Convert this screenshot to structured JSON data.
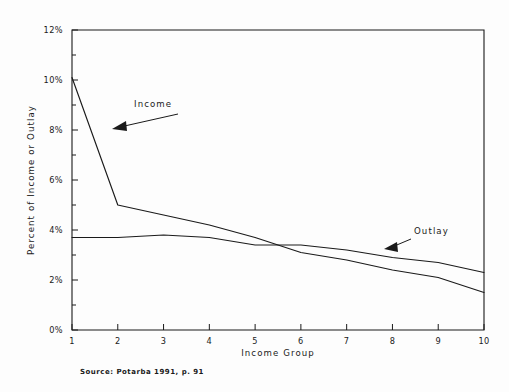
{
  "figure": {
    "background_color": "#fdfdfd",
    "ink_color": "#1a1a1a",
    "source_note": "Source: Potarba 1991, p. 91"
  },
  "annotations": [
    {
      "name": "income",
      "label": "Income"
    },
    {
      "name": "outlay",
      "label": "Outlay"
    }
  ],
  "chart_data": {
    "type": "line",
    "title": "",
    "xlabel": "Income Group",
    "ylabel": "Percent of Income or Outlay",
    "categories": [
      1,
      2,
      3,
      4,
      5,
      6,
      7,
      8,
      9,
      10
    ],
    "x": [
      1,
      2,
      3,
      4,
      5,
      6,
      7,
      8,
      9,
      10
    ],
    "xlim": [
      1,
      10
    ],
    "ylim": [
      0,
      12
    ],
    "xticks": [
      "1",
      "2",
      "3",
      "4",
      "5",
      "6",
      "7",
      "8",
      "9",
      "10"
    ],
    "yticks": [
      "0%",
      "2%",
      "4%",
      "6%",
      "8%",
      "10%",
      "12%"
    ],
    "ytick_values": [
      0,
      2,
      4,
      6,
      8,
      10,
      12
    ],
    "minor_yticks": [
      1,
      3,
      5,
      7,
      9,
      11
    ],
    "grid": false,
    "legend": "none",
    "legend_position": "inline-annotations",
    "series": [
      {
        "name": "Income",
        "values": [
          10.1,
          5.0,
          4.6,
          4.2,
          3.7,
          3.1,
          2.8,
          2.4,
          2.1,
          1.5
        ]
      },
      {
        "name": "Outlay",
        "values": [
          3.7,
          3.7,
          3.8,
          3.7,
          3.4,
          3.4,
          3.2,
          2.9,
          2.7,
          2.3
        ]
      }
    ]
  }
}
